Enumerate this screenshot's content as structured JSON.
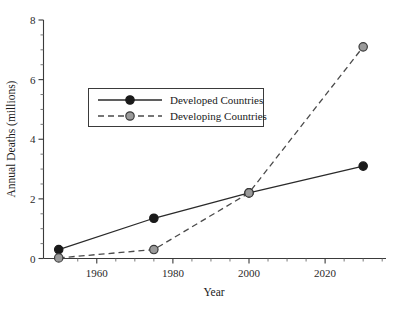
{
  "chart_data": {
    "type": "line",
    "title": "",
    "xlabel": "Year",
    "ylabel": "Annual Deaths (millions)",
    "xlim": [
      1946,
      2036
    ],
    "ylim": [
      0,
      8
    ],
    "x_major_ticks": [
      1960,
      1980,
      2000,
      2020
    ],
    "x_major_tick_labels": [
      "1960",
      "1980",
      "2000",
      "2020"
    ],
    "x_minor_tick_step": 5,
    "y_major_ticks": [
      0,
      2,
      4,
      6,
      8
    ],
    "y_major_tick_labels": [
      "0",
      "2",
      "4",
      "6",
      "8"
    ],
    "y_minor_tick_step": 0.5,
    "grid": false,
    "legend_position": "upper-left-inside",
    "x": [
      1950,
      1975,
      2000,
      2030
    ],
    "series": [
      {
        "name": "Developed Countries",
        "values": [
          0.3,
          1.35,
          2.2,
          3.1
        ],
        "line_style": "solid",
        "marker": "filled-circle",
        "marker_fill": "#1a1a1a",
        "marker_edge": "#1a1a1a",
        "line_color": "#2a2a2a"
      },
      {
        "name": "Developing Countries",
        "values": [
          0.02,
          0.3,
          2.2,
          7.1
        ],
        "line_style": "dashed",
        "marker": "filled-circle",
        "marker_fill": "#9a9a9a",
        "marker_edge": "#3a3a3a",
        "line_color": "#4a4a4a"
      }
    ]
  },
  "legend": {
    "entries": [
      {
        "label": "Developed Countries"
      },
      {
        "label": "Developing Countries"
      }
    ]
  },
  "axes": {
    "x_title": "Year",
    "y_title": "Annual Deaths (millions)"
  }
}
